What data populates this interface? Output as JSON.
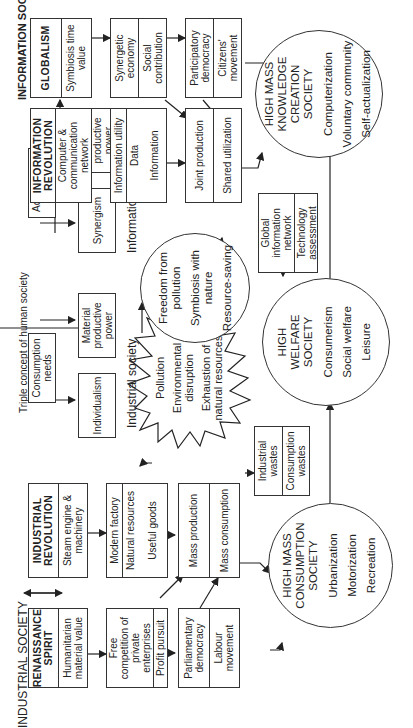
{
  "section_labels": {
    "industrial_society": "INDUSTRIAL SOCIETY",
    "information_society": "INFORMATION SOCIETY",
    "triple_concept": "Triple concept of human society",
    "industrial_society_lower": "Industrial society",
    "information_society_lower": "Information society"
  },
  "industrial_row": {
    "renaissance": {
      "title": "RENAISSANCE SPIRIT",
      "body": "Humanitarian material value"
    },
    "industrial_revolution": {
      "title": "INDUSTRIAL REVOLUTION",
      "body": "Steam engine & machinery"
    },
    "free_competition": {
      "top": "Free competition of private enterprises",
      "bottom": "Profit pursuit"
    },
    "modern_factory": {
      "top": "Modern factory",
      "mid": "Natural resources",
      "bottom": "Useful goods"
    },
    "parliamentary": {
      "top": "Parliamentary democracy",
      "bottom": "Labour movement"
    },
    "mass": {
      "top": "Mass production",
      "bottom": "Mass consumption"
    }
  },
  "needs": {
    "consumption": "Consumption needs",
    "individualism": "Individualism",
    "material_power": "Material productive power",
    "achievement": "Achievement needs",
    "synergism": "Synergism",
    "information_power": "Information productive power"
  },
  "burst": {
    "items": [
      "Pollution",
      "Environmental disruption",
      "Exhaustion of natural resources"
    ]
  },
  "wastes": {
    "top": "Industrial wastes",
    "bottom": "Consumption wastes"
  },
  "nature_circle": {
    "items": [
      "Freedom from pollution",
      "Symbiosis with nature",
      "Resource-saving"
    ]
  },
  "global_network": {
    "top": "Global information network",
    "bottom": "Technology assessment"
  },
  "information_row": {
    "info_revolution": {
      "title": "INFORMATION REVOLUTION",
      "body": "Computer & communication network"
    },
    "globalism": {
      "title": "GLOBALISM",
      "body": "Symbiosis time value"
    },
    "info_utility": {
      "top": "Information utility",
      "mid": "Data",
      "bottom": "Information"
    },
    "synergetic": {
      "top": "Synergetic economy",
      "bottom": "Social contribution"
    },
    "joint": {
      "top": "Joint production",
      "bottom": "Shared utilization"
    },
    "participatory": {
      "top": "Participatory democracy",
      "bottom": "Citizens' movement"
    }
  },
  "societies": {
    "mass_consumption": {
      "title": "HIGH MASS CONSUMPTION SOCIETY",
      "items": [
        "Urbanization",
        "Motorization",
        "Recreation"
      ]
    },
    "welfare": {
      "title": "HIGH WELFARE SOCIETY",
      "items": [
        "Consumerism",
        "Social welfare",
        "Leisure"
      ]
    },
    "knowledge": {
      "title": "HIGH MASS KNOWLEDGE CREATION SOCIETY",
      "items": [
        "Computerization",
        "Voluntary community",
        "Self-actualization"
      ]
    }
  }
}
